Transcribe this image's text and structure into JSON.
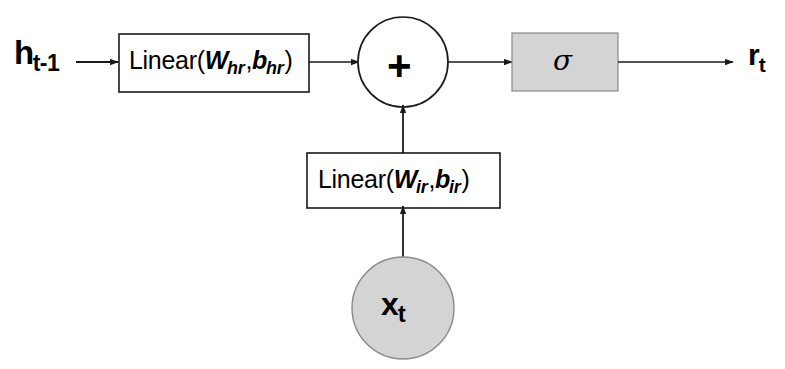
{
  "figure": {
    "background_color": "#ffffff",
    "stroke_color": "#1a1a1a",
    "fill_gray": "#d4d4d4"
  },
  "nodes": {
    "input_hidden": {
      "name": "previous hidden state",
      "base": "h",
      "subscript": "t-1"
    },
    "input_x": {
      "name": "current input",
      "base": "x",
      "subscript": "t"
    },
    "output_r": {
      "name": "reset gate output",
      "base": "r",
      "subscript": "t"
    },
    "linear_hr": {
      "name": "hidden linear transform",
      "prefix": "Linear(",
      "weight": "W",
      "weight_sub": "hr",
      "separator": ",",
      "bias": "b",
      "bias_sub": "hr",
      "suffix": ")"
    },
    "linear_ir": {
      "name": "input linear transform",
      "prefix": "Linear(",
      "weight": "W",
      "weight_sub": "ir",
      "separator": ",",
      "bias": "b",
      "bias_sub": "ir",
      "suffix": ")"
    },
    "adder": {
      "name": "summation node",
      "symbol": "+"
    },
    "activation": {
      "name": "sigmoid activation",
      "symbol": "σ"
    }
  },
  "edges": [
    {
      "name": "h-to-linear-hr",
      "from": "input_hidden",
      "to": "linear_hr",
      "arrow": true
    },
    {
      "name": "linear-hr-to-adder",
      "from": "linear_hr",
      "to": "adder",
      "arrow": true
    },
    {
      "name": "adder-to-sigma",
      "from": "adder",
      "to": "activation",
      "arrow": true
    },
    {
      "name": "sigma-to-r",
      "from": "activation",
      "to": "output_r",
      "arrow": true
    },
    {
      "name": "x-to-linear-ir",
      "from": "input_x",
      "to": "linear_ir",
      "arrow": true
    },
    {
      "name": "linear-ir-to-adder",
      "from": "linear_ir",
      "to": "adder",
      "arrow": true
    }
  ]
}
